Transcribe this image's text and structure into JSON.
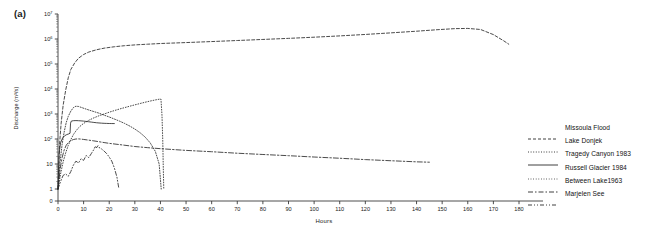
{
  "panel": {
    "label": "(a)"
  },
  "axes": {
    "x": {
      "title": "Hours",
      "min": 0,
      "max": 180,
      "tick_step": 10,
      "ticks": [
        0,
        10,
        20,
        30,
        40,
        50,
        60,
        70,
        80,
        90,
        100,
        110,
        120,
        130,
        140,
        150,
        160,
        170,
        180
      ]
    },
    "y": {
      "title": "Discharge (m³/s)",
      "scale": "log",
      "tick_labels": [
        "0",
        "1",
        "10",
        "10²",
        "10³",
        "10⁴",
        "10⁵",
        "10⁶",
        "10⁷"
      ],
      "tick_values": [
        0,
        1,
        10,
        100,
        1000,
        10000,
        100000,
        1000000,
        10000000
      ],
      "minor_ticks": true
    }
  },
  "legend": {
    "position": "right",
    "items": [
      {
        "label": "Missoula Flood",
        "dash": "3,2",
        "color": "#2a2a2a"
      },
      {
        "label": "Lake Donjek",
        "dash": "1,1.6",
        "color": "#2a2a2a"
      },
      {
        "label": "Tragedy Canyon 1983",
        "dash": "none",
        "color": "#2a2a2a"
      },
      {
        "label": "Russell Glacier 1984",
        "dash": "0.8,1.8",
        "color": "#2a2a2a"
      },
      {
        "label": "Between Lake1963",
        "dash": "5,2,1.5,2",
        "color": "#2a2a2a"
      },
      {
        "label": "Marjelen See",
        "dash": "4,2,1,2,1,2",
        "color": "#2a2a2a"
      }
    ]
  },
  "chart_data": {
    "type": "line",
    "title": "",
    "xlabel": "Hours",
    "ylabel": "Discharge (m³/s)",
    "yscale": "log",
    "xlim": [
      0,
      180
    ],
    "ylim": [
      0,
      10000000
    ],
    "grid": false,
    "series": [
      {
        "name": "Missoula Flood",
        "points": [
          [
            0,
            1
          ],
          [
            0.6,
            60
          ],
          [
            1.2,
            400
          ],
          [
            2,
            2200
          ],
          [
            3,
            9000
          ],
          [
            4,
            28000
          ],
          [
            5,
            60000
          ],
          [
            6.5,
            110000
          ],
          [
            8,
            170000
          ],
          [
            10,
            240000
          ],
          [
            12,
            300000
          ],
          [
            15,
            370000
          ],
          [
            18,
            430000
          ],
          [
            22,
            490000
          ],
          [
            26,
            540000
          ],
          [
            30,
            580000
          ],
          [
            35,
            620000
          ],
          [
            40,
            660000
          ],
          [
            50,
            720000
          ],
          [
            60,
            790000
          ],
          [
            70,
            870000
          ],
          [
            80,
            960000
          ],
          [
            90,
            1060000
          ],
          [
            100,
            1180000
          ],
          [
            110,
            1330000
          ],
          [
            120,
            1520000
          ],
          [
            130,
            1760000
          ],
          [
            140,
            2050000
          ],
          [
            148,
            2350000
          ],
          [
            155,
            2600000
          ],
          [
            160,
            2650000
          ],
          [
            165,
            2400000
          ],
          [
            170,
            1500000
          ],
          [
            174,
            850000
          ],
          [
            176,
            620000
          ]
        ]
      },
      {
        "name": "Lake Donjek",
        "points": [
          [
            0,
            1
          ],
          [
            0.8,
            12
          ],
          [
            1.6,
            60
          ],
          [
            2.4,
            190
          ],
          [
            3.2,
            450
          ],
          [
            4,
            800
          ],
          [
            5,
            1300
          ],
          [
            6,
            1800
          ],
          [
            7,
            2050
          ],
          [
            8,
            2000
          ],
          [
            9,
            1850
          ],
          [
            10,
            1700
          ],
          [
            12,
            1450
          ],
          [
            14,
            1250
          ],
          [
            16,
            1080
          ],
          [
            18,
            900
          ],
          [
            20,
            760
          ],
          [
            22,
            630
          ],
          [
            24,
            520
          ],
          [
            26,
            420
          ],
          [
            28,
            330
          ],
          [
            30,
            250
          ],
          [
            32,
            180
          ],
          [
            34,
            120
          ],
          [
            36,
            70
          ],
          [
            38,
            32
          ],
          [
            39.5,
            10
          ],
          [
            40.3,
            1
          ]
        ]
      },
      {
        "name": "Tragedy Canyon 1983",
        "points": [
          [
            0,
            1
          ],
          [
            0.4,
            25
          ],
          [
            1,
            70
          ],
          [
            1.8,
            110
          ],
          [
            2.6,
            135
          ],
          [
            3.4,
            150
          ],
          [
            4.2,
            160
          ],
          [
            4.7,
            170
          ],
          [
            4.9,
            430
          ],
          [
            5.2,
            520
          ],
          [
            6,
            540
          ],
          [
            7,
            545
          ],
          [
            8,
            540
          ],
          [
            9,
            530
          ],
          [
            10,
            520
          ],
          [
            11,
            505
          ],
          [
            12,
            490
          ],
          [
            13,
            475
          ],
          [
            14,
            460
          ],
          [
            15,
            448
          ],
          [
            16,
            438
          ],
          [
            17,
            430
          ],
          [
            18,
            424
          ],
          [
            19,
            420
          ],
          [
            20,
            417
          ],
          [
            21,
            415
          ],
          [
            22,
            414
          ]
        ]
      },
      {
        "name": "Russell Glacier 1984",
        "points": [
          [
            0,
            1
          ],
          [
            1,
            4
          ],
          [
            2,
            12
          ],
          [
            3,
            28
          ],
          [
            4,
            55
          ],
          [
            5,
            95
          ],
          [
            6,
            150
          ],
          [
            7,
            210
          ],
          [
            8,
            280
          ],
          [
            9,
            350
          ],
          [
            10,
            420
          ],
          [
            12,
            560
          ],
          [
            14,
            700
          ],
          [
            16,
            850
          ],
          [
            18,
            1000
          ],
          [
            20,
            1180
          ],
          [
            22,
            1370
          ],
          [
            24,
            1580
          ],
          [
            26,
            1800
          ],
          [
            28,
            2050
          ],
          [
            30,
            2320
          ],
          [
            32,
            2620
          ],
          [
            34,
            2950
          ],
          [
            36,
            3300
          ],
          [
            38,
            3650
          ],
          [
            39.5,
            3900
          ],
          [
            40.2,
            3950
          ],
          [
            40.6,
            900
          ],
          [
            40.9,
            90
          ],
          [
            41.1,
            8
          ],
          [
            41.3,
            1
          ]
        ]
      },
      {
        "name": "Between Lake1963",
        "points": [
          [
            0,
            1
          ],
          [
            0.8,
            6
          ],
          [
            1.6,
            18
          ],
          [
            2.4,
            36
          ],
          [
            3.2,
            56
          ],
          [
            4,
            72
          ],
          [
            5,
            86
          ],
          [
            6,
            95
          ],
          [
            7,
            100
          ],
          [
            8,
            101
          ],
          [
            9,
            99
          ],
          [
            10,
            96
          ],
          [
            12,
            90
          ],
          [
            14,
            84
          ],
          [
            16,
            78
          ],
          [
            18,
            72
          ],
          [
            20,
            67
          ],
          [
            25,
            58
          ],
          [
            30,
            50
          ],
          [
            35,
            45
          ],
          [
            40,
            41
          ],
          [
            50,
            35
          ],
          [
            60,
            31
          ],
          [
            70,
            27
          ],
          [
            80,
            24
          ],
          [
            90,
            21.5
          ],
          [
            100,
            19
          ],
          [
            110,
            17
          ],
          [
            120,
            15
          ],
          [
            130,
            13.5
          ],
          [
            140,
            12.2
          ],
          [
            145,
            11.8
          ]
        ]
      },
      {
        "name": "Marjelen See",
        "points": [
          [
            0,
            1
          ],
          [
            1,
            2
          ],
          [
            2,
            3.5
          ],
          [
            3,
            4
          ],
          [
            4,
            3.2
          ],
          [
            5,
            5
          ],
          [
            6,
            9
          ],
          [
            7,
            13
          ],
          [
            8,
            11
          ],
          [
            9,
            16
          ],
          [
            10,
            14
          ],
          [
            11,
            22
          ],
          [
            12,
            18
          ],
          [
            13,
            26
          ],
          [
            14,
            38
          ],
          [
            14.6,
            52
          ],
          [
            15,
            44
          ],
          [
            15.6,
            54
          ],
          [
            16,
            46
          ],
          [
            17,
            40
          ],
          [
            18,
            33
          ],
          [
            19,
            26
          ],
          [
            20,
            19
          ],
          [
            21,
            13
          ],
          [
            22,
            7
          ],
          [
            23,
            3
          ],
          [
            23.8,
            1
          ]
        ]
      }
    ]
  }
}
